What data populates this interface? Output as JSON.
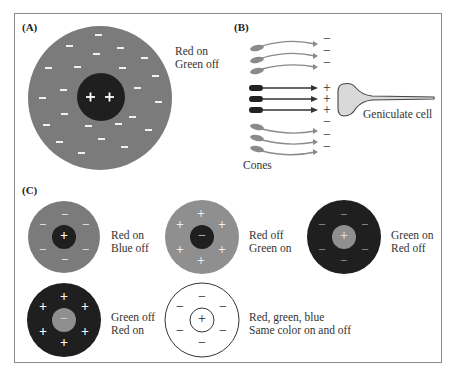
{
  "panels": {
    "A": {
      "label": "(A)",
      "caption_line1": "Red on",
      "caption_line2": "Green off",
      "center_symbols": [
        "+",
        "+"
      ],
      "surround_symbol": "−"
    },
    "B": {
      "label": "(B)",
      "cones_label": "Cones",
      "cell_label": "Geniculate cell",
      "signs": [
        "−",
        "−",
        "−",
        "+",
        "+",
        "+",
        "−",
        "−",
        "−"
      ]
    },
    "C": {
      "label": "(C)",
      "cells": [
        {
          "center": "+",
          "surround": "−",
          "caption_line1": "Red on",
          "caption_line2": "Blue off"
        },
        {
          "center": "−",
          "surround": "+",
          "caption_line1": "Red off",
          "caption_line2": "Green on"
        },
        {
          "center": "+",
          "surround": "−",
          "caption_line1": "Green on",
          "caption_line2": "Red off"
        },
        {
          "center": "−",
          "surround": "+",
          "caption_line1": "Green off",
          "caption_line2": "Red on"
        },
        {
          "center": "+",
          "surround": "−",
          "caption_line1": "Red, green, blue",
          "caption_line2": "Same color on and off"
        }
      ]
    }
  },
  "colors": {
    "mid_gray": "#7b7b7b",
    "light_gray": "#8f8f8f",
    "dark": "#1f1f1f",
    "cell_fill": "#d9d9d9",
    "frame": "#8a8a8a"
  }
}
